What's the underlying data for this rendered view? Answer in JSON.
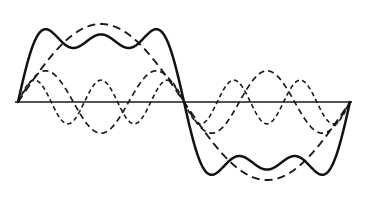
{
  "figure": {
    "background_color": "#ffffff",
    "ink_color": "#111111",
    "width": 365,
    "height": 204
  },
  "axis": {
    "name": "horizontal-zero-axis",
    "x_start": 15,
    "x_end": 352,
    "y": 102,
    "color": "#1a1a1a",
    "stroke_width": 1.6
  },
  "chart_data": {
    "type": "line",
    "subtitle": "",
    "xlabel": "",
    "ylabel": "",
    "grid": false,
    "legend_position": "none",
    "annotations": [],
    "x_domain": [
      0,
      2
    ],
    "y_domain": [
      -1.3,
      1.3
    ],
    "x_pixel_range": [
      18,
      350
    ],
    "y_pixel_zero": 102,
    "y_pixel_scale": 78,
    "x_tick_labels": [],
    "y_tick_labels": [],
    "series": [
      {
        "name": "Resultant (sum of 1st, 3rd and 5th harmonics)",
        "style": "solid",
        "stroke_width": 2.5,
        "color": "#111111",
        "harmonic_terms": [
          {
            "order": 1,
            "amplitude": 1.0
          },
          {
            "order": 3,
            "amplitude": 0.3333333333
          },
          {
            "order": 5,
            "amplitude": 0.2
          }
        ],
        "gain": 1.0,
        "formula": "sin(pi x) + sin(3 pi x)/3 + sin(5 pi x)/5"
      },
      {
        "name": "Fundamental (1st harmonic)",
        "style": "dashed-long",
        "stroke_width": 1.9,
        "color": "#1a1a1a",
        "harmonic_terms": [
          {
            "order": 1,
            "amplitude": 1.0
          }
        ],
        "gain": 1.0,
        "formula": "sin(pi x)"
      },
      {
        "name": "Third harmonic",
        "style": "dashed-medium",
        "stroke_width": 1.7,
        "color": "#1a1a1a",
        "harmonic_terms": [
          {
            "order": 3,
            "amplitude": 0.4
          }
        ],
        "gain": 1.0,
        "formula": "0.40 sin(3 pi x)"
      },
      {
        "name": "Fifth harmonic",
        "style": "dashed-short",
        "stroke_width": 1.6,
        "color": "#1a1a1a",
        "harmonic_terms": [
          {
            "order": 5,
            "amplitude": 0.28
          }
        ],
        "gain": 1.0,
        "formula": "0.28 sin(5 pi x)"
      }
    ]
  }
}
